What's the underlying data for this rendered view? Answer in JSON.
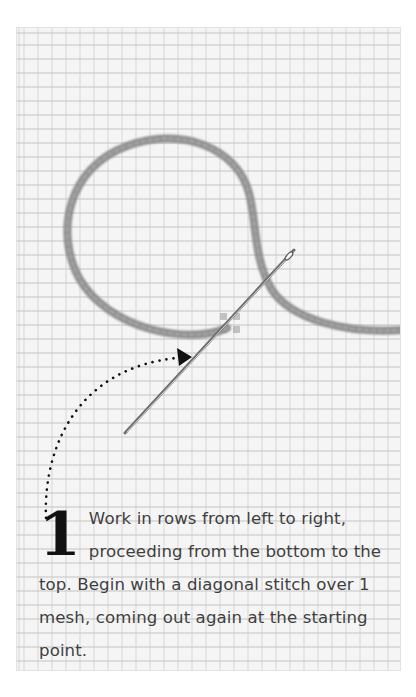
{
  "figure": {
    "illustration": {
      "subject": "plastic-canvas-mesh-with-yarn-and-needle",
      "colors": {
        "mesh_bg": "#f5f5f5",
        "mesh_lines": "#c8c8c8",
        "yarn": "#8a8a8a",
        "needle": "#7a7a7a",
        "arrow": "#111111",
        "text": "#3f3f3f",
        "step_number": "#111111"
      }
    },
    "step": {
      "number": "1",
      "text": "Work in rows from left to right, proceeding from the bottom to the top. Begin with a diagonal stitch over 1 mesh, coming out again at the starting point."
    }
  }
}
